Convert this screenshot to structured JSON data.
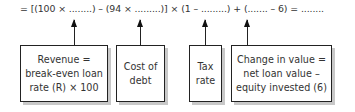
{
  "equation": {
    "text": "= [(100 × ........) – (94 × .........)] × (1 – .........) + (....... – 6) = ........"
  },
  "boxes": [
    {
      "label": "Revenue =\nbreak-even loan\nrate (R) × 100"
    },
    {
      "label": "Cost of\ndebt"
    },
    {
      "label": "Tax\nrate"
    },
    {
      "label": "Change in value =\nnet loan value –\nequity invested (6)"
    }
  ],
  "colors": {
    "line": "#222222",
    "shadow": "#c8c8c8",
    "text": "#333333",
    "background": "#ffffff"
  }
}
